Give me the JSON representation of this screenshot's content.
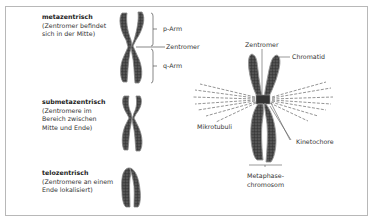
{
  "types": [
    {
      "title": "metazentrisch",
      "lines": [
        "(Zentromer befindet",
        "sich in der Mitte)"
      ]
    },
    {
      "title": "submetazentrisch",
      "lines": [
        "(Zentromere im",
        "Bereich zwischen",
        "Mitte und Ende)"
      ]
    },
    {
      "title": "telozentrisch",
      "lines": [
        "(Zentromere an einem",
        "Ende lokalisiert)"
      ]
    }
  ],
  "arm_labels": {
    "p_arm": "p-Arm",
    "zentromer": "Zentromer",
    "q_arm": "q-Arm"
  },
  "metaphase": {
    "zentromer": "Zentromer",
    "chromatid": "Chromatid",
    "mikrotubuli": "Mikrotubuli",
    "kinetochore": "Kinetochore",
    "caption_line1": "Metaphase-",
    "caption_line2": "chromosom"
  },
  "colors": {
    "frame": "#b8b8b8",
    "chromosome": "#3a3a3a",
    "text": "#333333",
    "line": "#555555"
  }
}
